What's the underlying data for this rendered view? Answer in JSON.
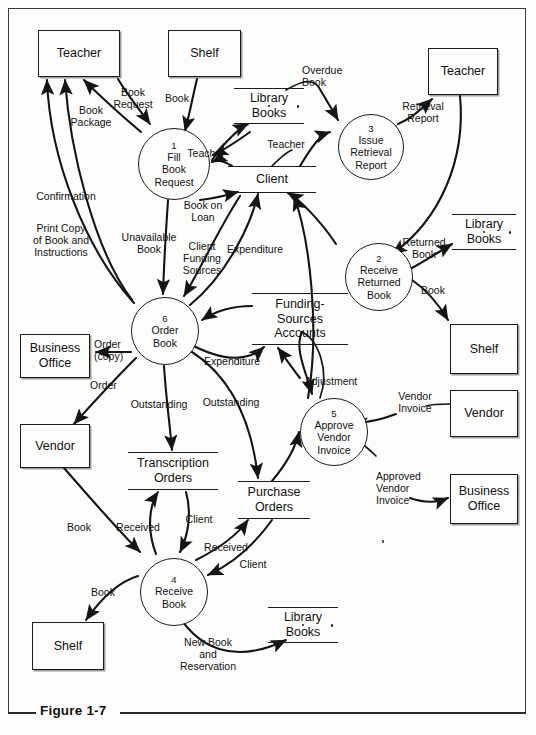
{
  "figure": {
    "caption": "Figure 1-7"
  },
  "diagram": {
    "type": "data-flow-diagram",
    "entities": [
      {
        "id": "teacher-top-left",
        "label": "Teacher",
        "x": 38,
        "y": 30,
        "w": 82,
        "h": 47
      },
      {
        "id": "shelf-top",
        "label": "Shelf",
        "x": 168,
        "y": 30,
        "w": 73,
        "h": 47
      },
      {
        "id": "teacher-top-right",
        "label": "Teacher",
        "x": 428,
        "y": 48,
        "w": 70,
        "h": 47
      },
      {
        "id": "shelf-right",
        "label": "Shelf",
        "x": 450,
        "y": 324,
        "w": 68,
        "h": 50
      },
      {
        "id": "vendor-right",
        "label": "Vendor",
        "x": 450,
        "y": 390,
        "w": 68,
        "h": 47
      },
      {
        "id": "business-office-right",
        "label": "Business\nOffice",
        "x": 450,
        "y": 474,
        "w": 68,
        "h": 50
      },
      {
        "id": "business-office-left",
        "label": "Business\nOffice",
        "x": 20,
        "y": 334,
        "w": 70,
        "h": 44
      },
      {
        "id": "vendor-left",
        "label": "Vendor",
        "x": 20,
        "y": 424,
        "w": 70,
        "h": 44
      },
      {
        "id": "shelf-bottom",
        "label": "Shelf",
        "x": 32,
        "y": 622,
        "w": 72,
        "h": 48
      }
    ],
    "processes": [
      {
        "id": "p1",
        "number": "1",
        "label": "Fill\nBook\nRequest",
        "x": 138,
        "y": 128,
        "d": 72
      },
      {
        "id": "p2",
        "number": "2",
        "label": "Receive\nReturned\nBook",
        "x": 345,
        "y": 243,
        "d": 68
      },
      {
        "id": "p3",
        "number": "3",
        "label": "Issue\nRetrieval\nReport",
        "x": 338,
        "y": 114,
        "d": 66
      },
      {
        "id": "p4",
        "number": "4",
        "label": "Receive\nBook",
        "x": 140,
        "y": 558,
        "d": 68
      },
      {
        "id": "p5",
        "number": "5",
        "label": "Approve\nVendor\nInvoice",
        "x": 300,
        "y": 398,
        "d": 68
      },
      {
        "id": "p6",
        "number": "6",
        "label": "Order\nBook",
        "x": 131,
        "y": 297,
        "d": 68
      }
    ],
    "datastores": [
      {
        "id": "library-books-top",
        "label": "Library\nBooks",
        "x": 234,
        "y": 88,
        "w": 70,
        "h": 36,
        "dots": true
      },
      {
        "id": "client",
        "label": "Client",
        "x": 228,
        "y": 166,
        "w": 88,
        "h": 27,
        "dots": false
      },
      {
        "id": "library-books-right",
        "label": "Library\nBooks",
        "x": 452,
        "y": 214,
        "w": 64,
        "h": 36,
        "dots": true
      },
      {
        "id": "funding-sources-accounts",
        "label": "Funding-\nSources\nAccounts",
        "x": 252,
        "y": 293,
        "w": 96,
        "h": 52,
        "dots": false
      },
      {
        "id": "transcription-orders",
        "label": "Transcription\nOrders",
        "x": 128,
        "y": 452,
        "w": 90,
        "h": 38,
        "dots": false
      },
      {
        "id": "purchase-orders",
        "label": "Purchase\nOrders",
        "x": 238,
        "y": 481,
        "w": 72,
        "h": 38,
        "dots": false
      },
      {
        "id": "library-books-bottom",
        "label": "Library\nBooks",
        "x": 268,
        "y": 607,
        "w": 70,
        "h": 36,
        "dots": true
      }
    ],
    "flows": [
      {
        "id": "f-book-request",
        "label": "Book\nRequest",
        "from": "teacher-top-left",
        "to": "p1",
        "lx": 110,
        "ly": 88
      },
      {
        "id": "f-book-package",
        "label": "Book\nPackage",
        "from": "p1",
        "to": "teacher-top-left",
        "lx": 70,
        "ly": 104
      },
      {
        "id": "f-confirmation",
        "label": "Confirmation",
        "from": "p6",
        "to": "teacher-top-left",
        "lx": 31,
        "ly": 196
      },
      {
        "id": "f-print-copy",
        "label": "Print Copy\nof Book and\nInstructions",
        "from": "p6",
        "to": "teacher-top-left",
        "lx": 30,
        "ly": 238
      },
      {
        "id": "f-book-shelf",
        "label": "Book",
        "from": "shelf-top",
        "to": "p1",
        "lx": 172,
        "ly": 95
      },
      {
        "id": "f-overdue-book",
        "label": "Overdue\nBook",
        "from": "library-books-top",
        "to": "p3",
        "lx": 304,
        "ly": 71
      },
      {
        "id": "f-teacher-p1",
        "label": "Teacher",
        "from": "client",
        "to": "p1",
        "lx": 184,
        "ly": 153
      },
      {
        "id": "f-teacher-p3",
        "label": "Teacher",
        "from": "client",
        "to": "p3",
        "lx": 268,
        "ly": 143
      },
      {
        "id": "f-retrieval-report",
        "label": "Retrieval\nReport",
        "from": "p3",
        "to": "teacher-top-right",
        "lx": 400,
        "ly": 107
      },
      {
        "id": "f-returned-book",
        "label": "Returned\nBook",
        "from": "teacher-top-right",
        "to": "p2",
        "lx": 422,
        "ly": 243
      },
      {
        "id": "f-book-on-loan",
        "label": "Book on\nLoan",
        "from": "p1",
        "to": "client",
        "lx": 182,
        "ly": 206
      },
      {
        "id": "f-unavailable-book",
        "label": "Unavailable\nBook",
        "from": "p1",
        "to": "p6",
        "lx": 121,
        "ly": 238
      },
      {
        "id": "f-client-funding-sources",
        "label": "Client\nFunding\nSources",
        "from": "client",
        "to": "p6",
        "lx": 182,
        "ly": 247
      },
      {
        "id": "f-expenditure-client",
        "label": "Expenditure",
        "from": "p6",
        "to": "client",
        "lx": 228,
        "ly": 249
      },
      {
        "id": "f-expenditure-fsa",
        "label": "Expenditure",
        "from": "p6",
        "to": "funding-sources-accounts",
        "lx": 206,
        "ly": 360
      },
      {
        "id": "f-order-copy",
        "label": "Order\n(copy)",
        "from": "p6",
        "to": "business-office-left",
        "lx": 95,
        "ly": 346
      },
      {
        "id": "f-order-vendor",
        "label": "Order",
        "from": "p6",
        "to": "vendor-left",
        "lx": 92,
        "ly": 385
      },
      {
        "id": "f-outstanding-transcription",
        "label": "Outstanding",
        "from": "p6",
        "to": "transcription-orders",
        "lx": 131,
        "ly": 403
      },
      {
        "id": "f-outstanding-purchase",
        "label": "Outstanding",
        "from": "p6",
        "to": "purchase-orders",
        "lx": 203,
        "ly": 401
      },
      {
        "id": "f-book-vendor-p4",
        "label": "Book",
        "from": "vendor-left",
        "to": "p4",
        "lx": 70,
        "ly": 527
      },
      {
        "id": "f-received-transcription",
        "label": "Received",
        "from": "p4",
        "to": "transcription-orders",
        "lx": 127,
        "ly": 527
      },
      {
        "id": "f-client-transcription",
        "label": "Client",
        "from": "transcription-orders",
        "to": "p4",
        "lx": 190,
        "ly": 518
      },
      {
        "id": "f-received-purchase",
        "label": "Received",
        "from": "p4",
        "to": "purchase-orders",
        "lx": 209,
        "ly": 547
      },
      {
        "id": "f-client-purchase",
        "label": "Client",
        "from": "purchase-orders",
        "to": "p4",
        "lx": 243,
        "ly": 564
      },
      {
        "id": "f-book-p4-shelf",
        "label": "Book",
        "from": "p4",
        "to": "shelf-bottom",
        "lx": 93,
        "ly": 592
      },
      {
        "id": "f-new-book-reservation",
        "label": "New Book\nand\nReservation",
        "from": "p4",
        "to": "library-books-bottom",
        "lx": 180,
        "ly": 643
      },
      {
        "id": "f-adjustment",
        "label": "Adjustment",
        "from": "p5",
        "to": "funding-sources-accounts",
        "lx": 309,
        "ly": 374
      },
      {
        "id": "f-vendor-invoice",
        "label": "Vendor\nInvoice",
        "from": "vendor-right",
        "to": "p5",
        "lx": 390,
        "ly": 395
      },
      {
        "id": "f-approved-vendor-invoice",
        "label": "Approved\nVendor\nInvoice",
        "from": "p5",
        "to": "business-office-right",
        "lx": 378,
        "ly": 463
      },
      {
        "id": "f-book-p2-shelf",
        "label": "Book",
        "from": "p2",
        "to": "shelf-right",
        "lx": 428,
        "ly": 289
      },
      {
        "id": "f-p2-library-books",
        "label": "",
        "from": "p2",
        "to": "library-books-right",
        "lx": 0,
        "ly": 0
      }
    ]
  }
}
